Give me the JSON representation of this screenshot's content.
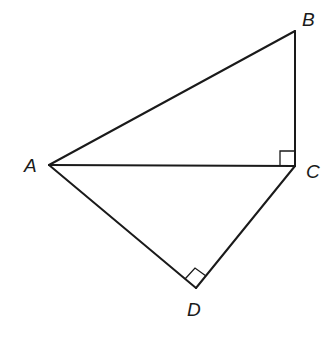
{
  "diagram": {
    "type": "geometry",
    "points": {
      "A": {
        "label": "A",
        "x": 49,
        "y": 165
      },
      "B": {
        "label": "B",
        "x": 295,
        "y": 31
      },
      "C": {
        "label": "C",
        "x": 295,
        "y": 166
      },
      "D": {
        "label": "D",
        "x": 196,
        "y": 288
      }
    },
    "segments": [
      {
        "id": "AB",
        "from": "A",
        "to": "B"
      },
      {
        "id": "BC",
        "from": "B",
        "to": "C"
      },
      {
        "id": "AC",
        "from": "A",
        "to": "C"
      },
      {
        "id": "AD",
        "from": "A",
        "to": "D"
      },
      {
        "id": "DC",
        "from": "D",
        "to": "C"
      }
    ],
    "right_angles": [
      {
        "vertex": "C",
        "between": [
          "A",
          "B"
        ]
      },
      {
        "vertex": "D",
        "between": [
          "A",
          "C"
        ]
      }
    ],
    "labels": {
      "A": "A",
      "B": "B",
      "C": "C",
      "D": "D"
    },
    "colors": {
      "stroke": "#1a1a1a",
      "background": "#ffffff"
    }
  }
}
